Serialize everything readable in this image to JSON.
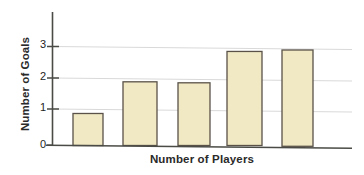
{
  "chart_data": {
    "type": "bar",
    "title": "",
    "xlabel": "Number of Players",
    "ylabel": "Number of Goals",
    "categories": [
      "",
      "",
      "",
      "",
      ""
    ],
    "values": [
      1.0,
      0.97,
      1.93,
      1.9,
      2.85
    ],
    "ylim": [
      0,
      3.4
    ],
    "ytick_labels": [
      "0",
      "1",
      "2",
      "3"
    ],
    "ytick_values": [
      0,
      1,
      2,
      3
    ],
    "xtick_labels": [],
    "grid": "horizontal",
    "legend": "none",
    "bar_fill_color": "#F0E9C4",
    "bar_border_color": "#5A5248",
    "axis_color": "#4A4A46",
    "gridline_color": "#D9D9D9",
    "background_color": "#FFFFFF"
  },
  "axes": {
    "y_title": "Number of Goals",
    "x_title": "Number of Players",
    "y_tick_0": "0",
    "y_tick_1": "1",
    "y_tick_2": "2",
    "y_tick_3": "3"
  }
}
